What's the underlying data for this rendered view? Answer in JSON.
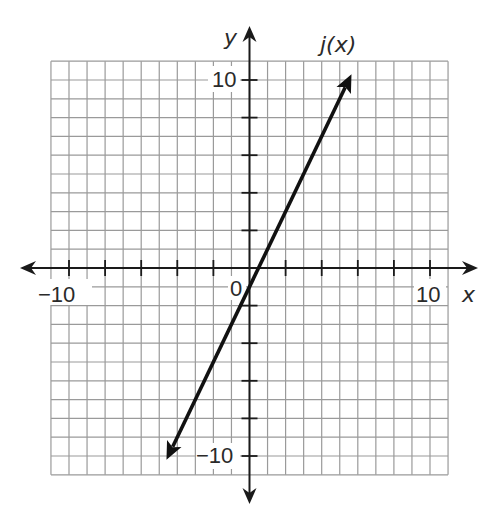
{
  "chart_data": {
    "type": "line",
    "title": "",
    "xlabel": "x",
    "ylabel": "y",
    "xlim": [
      -11,
      11
    ],
    "ylim": [
      -11,
      11
    ],
    "grid": true,
    "grid_step": 1,
    "tick_step": 2,
    "tick_labels": {
      "x": [
        {
          "value": -10,
          "label": "−10"
        },
        {
          "value": 10,
          "label": "10"
        }
      ],
      "y": [
        {
          "value": 10,
          "label": "10"
        },
        {
          "value": -10,
          "label": "−10"
        }
      ],
      "origin": "0"
    },
    "series": [
      {
        "name": "j(x)",
        "equation": "j(x) = 2x − 1",
        "slope": 2,
        "intercept": -1,
        "x": [
          -4.6,
          5.65
        ],
        "y": [
          -10.2,
          10.3
        ],
        "arrows": "both",
        "label_position": {
          "x": 4.4,
          "y": 11.3
        }
      }
    ]
  },
  "labels": {
    "x_axis": "x",
    "y_axis": "y",
    "function": "j(x)",
    "origin": "0",
    "x_min_label": "−10",
    "x_max_label": "10",
    "y_max_label": "10",
    "y_min_label": "−10"
  },
  "colors": {
    "grid": "#9a9a9a",
    "axis": "#1a1a1a",
    "line": "#111111",
    "background": "#ffffff"
  }
}
